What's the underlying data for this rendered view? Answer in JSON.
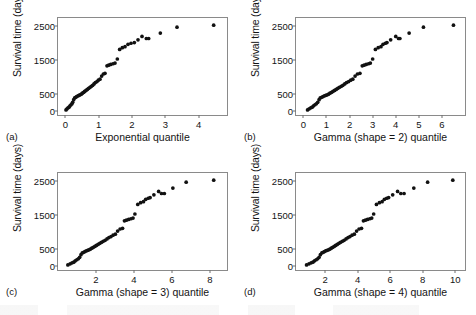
{
  "figure": {
    "type": "qq-plot-grid",
    "rows": 2,
    "columns": 2,
    "shared_ylabel": "Survival time (days)"
  },
  "chart_data": [
    {
      "type": "scatter",
      "panel": "(a)",
      "title": "",
      "xlabel": "Exponential quantile",
      "ylabel": "Survival time (days)",
      "xlim": [
        -0.22,
        4.85
      ],
      "ylim": [
        -120,
        2720
      ],
      "xticks": [
        0,
        1,
        2,
        3,
        4
      ],
      "yticks": [
        0,
        500,
        1500,
        2500
      ],
      "grid": false,
      "legend": "none",
      "x": [
        0.02,
        0.05,
        0.08,
        0.11,
        0.14,
        0.17,
        0.2,
        0.22,
        0.25,
        0.28,
        0.31,
        0.34,
        0.38,
        0.41,
        0.44,
        0.48,
        0.51,
        0.55,
        0.58,
        0.62,
        0.66,
        0.7,
        0.74,
        0.78,
        0.82,
        0.86,
        0.9,
        0.95,
        0.99,
        1.04,
        1.09,
        1.14,
        1.19,
        1.25,
        1.3,
        1.36,
        1.43,
        1.49,
        1.56,
        1.63,
        1.71,
        1.79,
        1.88,
        1.97,
        2.07,
        2.18,
        2.3,
        2.43,
        2.5,
        2.85,
        3.35,
        4.45
      ],
      "y": [
        30,
        60,
        90,
        110,
        150,
        180,
        210,
        250,
        330,
        380,
        400,
        420,
        440,
        455,
        470,
        490,
        520,
        545,
        570,
        600,
        630,
        660,
        690,
        720,
        750,
        790,
        830,
        860,
        900,
        930,
        1020,
        1080,
        1100,
        1320,
        1340,
        1360,
        1380,
        1400,
        1520,
        1800,
        1850,
        1880,
        1950,
        1980,
        2000,
        2080,
        2180,
        2120,
        2120,
        2280,
        2450,
        2510
      ]
    },
    {
      "type": "scatter",
      "panel": "(b)",
      "title": "",
      "xlabel": "Gamma (shape = 2) quantile",
      "ylabel": "Survival time (days)",
      "xlim": [
        -0.32,
        7.0
      ],
      "ylim": [
        -120,
        2720
      ],
      "xticks": [
        0,
        1,
        2,
        3,
        4,
        5,
        6
      ],
      "yticks": [
        0,
        500,
        1500,
        2500
      ],
      "grid": false,
      "legend": "none",
      "x": [
        0.18,
        0.25,
        0.32,
        0.38,
        0.44,
        0.5,
        0.56,
        0.62,
        0.68,
        0.73,
        0.79,
        0.85,
        0.91,
        0.97,
        1.03,
        1.09,
        1.15,
        1.22,
        1.28,
        1.35,
        1.42,
        1.49,
        1.56,
        1.64,
        1.71,
        1.79,
        1.87,
        1.96,
        2.05,
        2.14,
        2.24,
        2.34,
        2.45,
        2.55,
        2.63,
        2.72,
        2.82,
        2.9,
        3.0,
        3.12,
        3.24,
        3.36,
        3.45,
        3.55,
        3.62,
        3.78,
        4.0,
        4.12,
        4.18,
        4.58,
        5.2,
        6.5
      ],
      "y": [
        30,
        60,
        90,
        110,
        150,
        180,
        210,
        250,
        330,
        380,
        400,
        420,
        440,
        455,
        470,
        490,
        520,
        545,
        570,
        600,
        630,
        660,
        690,
        720,
        750,
        790,
        830,
        860,
        900,
        930,
        1020,
        1080,
        1100,
        1320,
        1340,
        1360,
        1380,
        1400,
        1520,
        1800,
        1850,
        1880,
        1950,
        1980,
        2000,
        2080,
        2180,
        2120,
        2120,
        2280,
        2450,
        2510
      ]
    },
    {
      "type": "scatter",
      "panel": "(c)",
      "title": "",
      "xlabel": "Gamma (shape = 3) quantile",
      "ylabel": "Survival time (days)",
      "xlim": [
        0.0,
        8.9
      ],
      "ylim": [
        -120,
        2720
      ],
      "xticks": [
        2,
        4,
        6,
        8
      ],
      "yticks": [
        0,
        500,
        1500,
        2500
      ],
      "grid": false,
      "legend": "none",
      "x": [
        0.52,
        0.64,
        0.74,
        0.83,
        0.91,
        0.99,
        1.07,
        1.14,
        1.21,
        1.28,
        1.35,
        1.42,
        1.49,
        1.56,
        1.63,
        1.7,
        1.78,
        1.86,
        1.94,
        2.02,
        2.11,
        2.2,
        2.29,
        2.38,
        2.48,
        2.58,
        2.68,
        2.79,
        2.9,
        3.02,
        3.14,
        3.27,
        3.4,
        3.5,
        3.6,
        3.72,
        3.84,
        3.95,
        4.05,
        4.2,
        4.35,
        4.5,
        4.62,
        4.75,
        4.85,
        5.05,
        5.3,
        5.45,
        5.6,
        6.05,
        6.75,
        8.2
      ],
      "y": [
        30,
        60,
        90,
        110,
        150,
        180,
        210,
        250,
        330,
        380,
        400,
        420,
        440,
        455,
        470,
        490,
        520,
        545,
        570,
        600,
        630,
        660,
        690,
        720,
        750,
        790,
        830,
        860,
        900,
        930,
        1020,
        1080,
        1100,
        1320,
        1340,
        1360,
        1380,
        1400,
        1520,
        1800,
        1850,
        1880,
        1950,
        1980,
        2000,
        2080,
        2180,
        2120,
        2120,
        2280,
        2450,
        2510
      ]
    },
    {
      "type": "scatter",
      "panel": "(d)",
      "title": "",
      "xlabel": "Gamma (shape = 4) quantile",
      "ylabel": "Survival time (days)",
      "xlim": [
        0.2,
        10.6
      ],
      "ylim": [
        -120,
        2720
      ],
      "xticks": [
        2,
        4,
        6,
        8,
        10
      ],
      "yticks": [
        0,
        500,
        1500,
        2500
      ],
      "grid": false,
      "legend": "none",
      "x": [
        0.85,
        1.0,
        1.13,
        1.24,
        1.34,
        1.44,
        1.53,
        1.62,
        1.7,
        1.79,
        1.87,
        1.95,
        2.03,
        2.11,
        2.2,
        2.28,
        2.37,
        2.46,
        2.55,
        2.64,
        2.74,
        2.84,
        2.94,
        3.05,
        3.16,
        3.28,
        3.4,
        3.52,
        3.65,
        3.79,
        3.93,
        4.08,
        4.23,
        4.35,
        4.47,
        4.6,
        4.74,
        4.86,
        4.98,
        5.15,
        5.33,
        5.5,
        5.64,
        5.78,
        5.9,
        6.15,
        6.45,
        6.65,
        6.85,
        7.45,
        8.3,
        9.85
      ],
      "y": [
        30,
        60,
        90,
        110,
        150,
        180,
        210,
        250,
        330,
        380,
        400,
        420,
        440,
        455,
        470,
        490,
        520,
        545,
        570,
        600,
        630,
        660,
        690,
        720,
        750,
        790,
        830,
        860,
        900,
        930,
        1020,
        1080,
        1100,
        1320,
        1340,
        1360,
        1380,
        1400,
        1520,
        1800,
        1850,
        1880,
        1950,
        1980,
        2000,
        2080,
        2180,
        2120,
        2120,
        2280,
        2450,
        2510
      ]
    }
  ]
}
